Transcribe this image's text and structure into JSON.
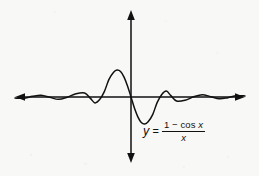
{
  "figure": {
    "background_color": "#f8f8f6",
    "stroke_color": "#111111",
    "equation": {
      "lhs": "y",
      "equals": "=",
      "numerator_one": "1",
      "numerator_minus": "−",
      "numerator_cos": "cos",
      "numerator_x": "x",
      "denominator": "x",
      "plain_text": "y = (1 − cos x) / x"
    },
    "axes": {
      "x_axis_label": "",
      "y_axis_label": "",
      "origin_x": 131,
      "origin_y": 97,
      "x_axis_left_tip": 15,
      "x_axis_right_tip": 245,
      "y_axis_top_tip": 10,
      "y_axis_bottom_tip": 163,
      "arrowheads": "double-headed"
    }
  },
  "chart_data": {
    "type": "line",
    "title": "",
    "subtitle": "",
    "xlabel": "",
    "ylabel": "",
    "legend": [],
    "legend_position": "none",
    "grid": false,
    "annotations": [
      {
        "text": "y = (1 − cos x) / x",
        "x_px": 180,
        "y_px": 133
      }
    ],
    "function": "y = (1 - cos x) / x",
    "xlim": [
      -20,
      20
    ],
    "ylim": [
      -0.8,
      0.8
    ],
    "series": [
      {
        "name": "y = (1 - cos x)/x",
        "color": "#111111",
        "x": [
          -20.0,
          -18.5,
          -17.0,
          -15.5,
          -14.0,
          -12.5,
          -11.0,
          -9.5,
          -8.0,
          -7.0,
          -6.2,
          -5.4,
          -4.6,
          -3.8,
          -3.0,
          -2.4,
          -1.8,
          -1.2,
          -0.6,
          0.0,
          0.6,
          1.2,
          1.8,
          2.4,
          3.0,
          3.8,
          4.6,
          5.4,
          6.2,
          7.0,
          8.0,
          9.5,
          11.0,
          12.5,
          14.0,
          15.5,
          17.0,
          18.5,
          20.0
        ],
        "y": [
          -0.029,
          -0.031,
          0.017,
          0.048,
          -0.009,
          -0.062,
          -0.005,
          0.086,
          0.107,
          -0.036,
          -0.157,
          -0.069,
          0.142,
          0.471,
          0.663,
          0.721,
          0.679,
          0.531,
          0.295,
          0.0,
          -0.295,
          -0.531,
          -0.679,
          -0.721,
          -0.663,
          -0.471,
          -0.142,
          0.069,
          0.157,
          0.036,
          -0.107,
          -0.086,
          0.005,
          0.062,
          0.009,
          -0.048,
          -0.017,
          0.031,
          0.029
        ]
      }
    ]
  }
}
